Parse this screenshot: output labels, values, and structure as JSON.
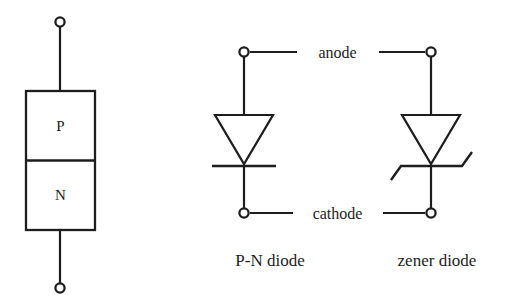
{
  "figure": {
    "background_color": "#ffffff",
    "ink_color": "#1d1d1d"
  },
  "pn_block": {
    "name": "pn-junction-block",
    "p_region_label": "P",
    "n_region_label": "N",
    "top_terminal": "open-circle-terminal",
    "bottom_terminal": "open-circle-terminal"
  },
  "node_labels": {
    "anode": "anode",
    "cathode": "cathode"
  },
  "symbols": [
    {
      "id": "pn-diode",
      "caption": "P-N diode",
      "kind": "triangle-with-flat-bar",
      "anode_terminal": "open-circle-terminal",
      "cathode_terminal": "open-circle-terminal"
    },
    {
      "id": "zener-diode",
      "caption": "zener diode",
      "kind": "triangle-with-z-bar",
      "anode_terminal": "open-circle-terminal",
      "cathode_terminal": "open-circle-terminal"
    }
  ],
  "captions": {
    "pn_diode": "P-N diode",
    "zener_diode": "zener diode"
  }
}
